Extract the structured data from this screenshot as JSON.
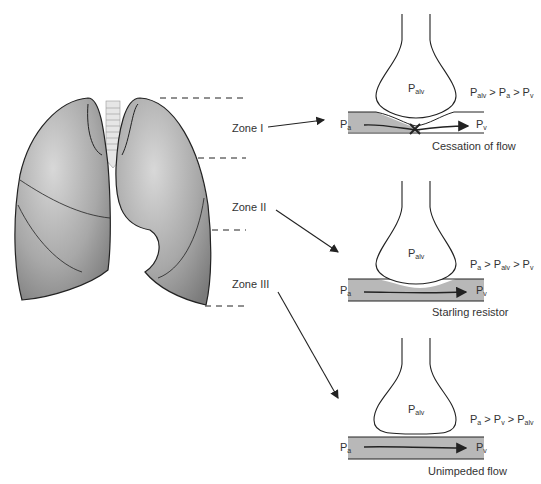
{
  "zones": [
    {
      "label": "Zone I",
      "condition_parts": [
        "P",
        "alv",
        " > P",
        "a",
        " > P",
        "v"
      ],
      "caption": "Cessation of flow"
    },
    {
      "label": "Zone II",
      "condition_parts": [
        "P",
        "a",
        " > P",
        "alv",
        " > P",
        "v"
      ],
      "caption": "Starling resistor"
    },
    {
      "label": "Zone III",
      "condition_parts": [
        "P",
        "a",
        " > P",
        "v",
        " > P",
        "alv"
      ],
      "caption": "Unimpeded flow"
    }
  ],
  "symbols": {
    "P": "P",
    "alv": "alv",
    "a": "a",
    "v": "v"
  },
  "colors": {
    "lung_fill": "#8f8f8f",
    "vessel_fill": "#b8b8b8",
    "line": "#222222"
  }
}
